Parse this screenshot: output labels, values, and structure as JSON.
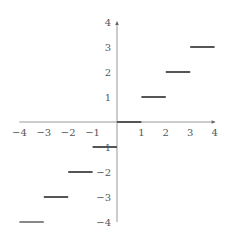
{
  "chart_data": {
    "type": "line",
    "title": "",
    "xlabel": "",
    "ylabel": "",
    "xlim": [
      -4,
      4
    ],
    "ylim": [
      -4,
      4
    ],
    "grid": false,
    "legend": null,
    "x_ticks": [
      -4,
      -3,
      -2,
      -1,
      1,
      2,
      3,
      4
    ],
    "y_ticks": [
      -4,
      -3,
      -2,
      -1,
      1,
      2,
      3,
      4
    ],
    "segments": [
      {
        "x0": -4,
        "x1": -3,
        "y": -4
      },
      {
        "x0": -3,
        "x1": -2,
        "y": -3
      },
      {
        "x0": -2,
        "x1": -1,
        "y": -2
      },
      {
        "x0": -1,
        "x1": 0,
        "y": -1
      },
      {
        "x0": 0,
        "x1": 1,
        "y": 0
      },
      {
        "x0": 1,
        "x1": 2,
        "y": 1
      },
      {
        "x0": 2,
        "x1": 3,
        "y": 2
      },
      {
        "x0": 3,
        "x1": 4,
        "y": 3
      }
    ]
  },
  "colors": {
    "axis": "#999999",
    "segment": "#555555",
    "tick_label": "#555555"
  }
}
